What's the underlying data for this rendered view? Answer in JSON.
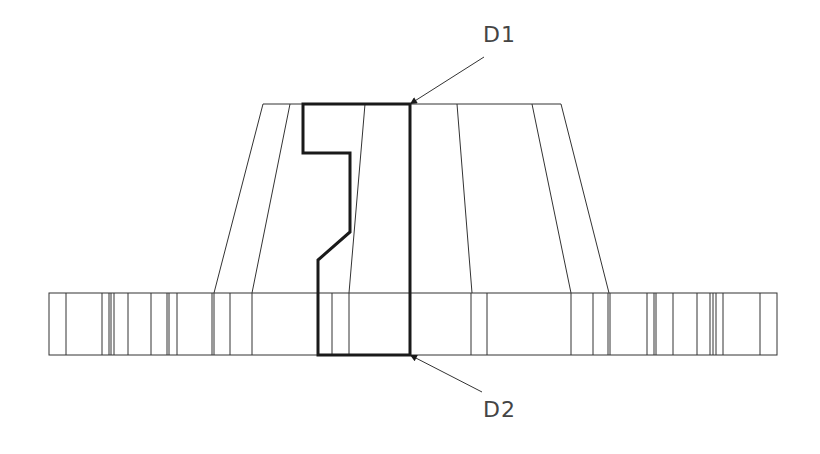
{
  "drawing": {
    "type": "technical-drawing",
    "subject": "flange with conical hub, section outline highlighted",
    "colors": {
      "line": "#333333",
      "outline": "#1a1a1a",
      "text": "#444444",
      "background": "#ffffff"
    },
    "cone": {
      "top_y": 104,
      "bottom_y": 293,
      "lines": [
        [
          263,
          104,
          214,
          293
        ],
        [
          290,
          104,
          252,
          293
        ],
        [
          365,
          104,
          349,
          293
        ],
        [
          457,
          104,
          472,
          293
        ],
        [
          532,
          104,
          571,
          293
        ],
        [
          561,
          104,
          609,
          293
        ]
      ]
    },
    "flange": {
      "left": 49,
      "right": 777,
      "top": 293,
      "bottom": 355,
      "vertical_lines_x": [
        66,
        102,
        109,
        111,
        114,
        128,
        151,
        167,
        169,
        177,
        212,
        214,
        230,
        252,
        332,
        349,
        471,
        487,
        571,
        593,
        608,
        610,
        647,
        654,
        656,
        673,
        697,
        710,
        713,
        716,
        723,
        760
      ]
    },
    "section_outline": {
      "points": "303,104 303,153 350,153 350,232 318,260 318,355 410,355 410,104"
    },
    "labels": [
      {
        "id": "D1",
        "text": "D1",
        "x": 483,
        "y": 22,
        "leader": [
          484,
          57,
          410,
          104
        ]
      },
      {
        "id": "D2",
        "text": "D2",
        "x": 483,
        "y": 397,
        "leader": [
          482,
          392,
          410,
          355
        ]
      }
    ]
  }
}
